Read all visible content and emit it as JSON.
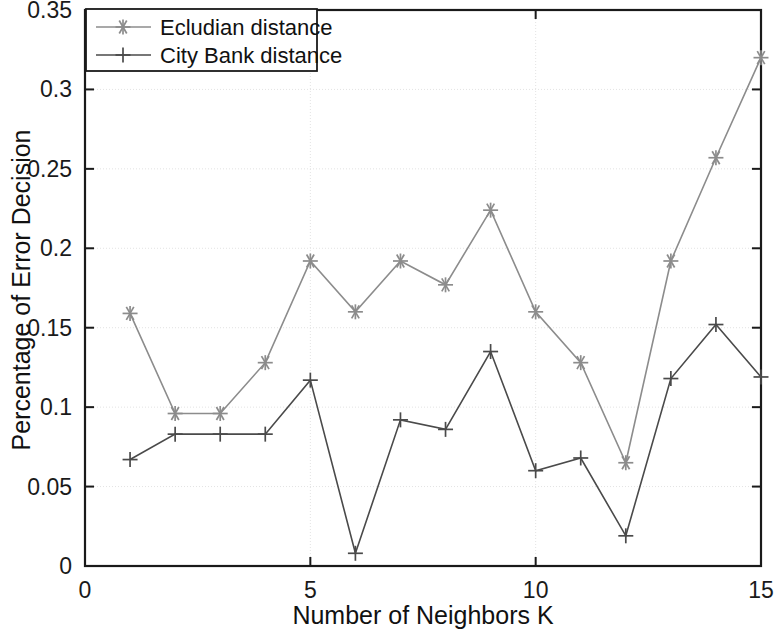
{
  "chart_data": {
    "type": "line",
    "title": "",
    "xlabel": "Number of Neighbors K",
    "ylabel": "Percentage of Error Decision",
    "xlim": [
      0,
      15
    ],
    "ylim": [
      0,
      0.35
    ],
    "xticks": [
      "0",
      "5",
      "10",
      "15"
    ],
    "xtick_values": [
      0,
      5,
      10,
      15
    ],
    "yticks": [
      "0",
      "0.05",
      "0.1",
      "0.15",
      "0.2",
      "0.25",
      "0.3",
      "0.35"
    ],
    "ytick_values": [
      0,
      0.05,
      0.1,
      0.15,
      0.2,
      0.25,
      0.3,
      0.35
    ],
    "grid": true,
    "legend_position": "top-left",
    "x": [
      1,
      2,
      3,
      4,
      5,
      6,
      7,
      8,
      9,
      10,
      11,
      12,
      13,
      14,
      15
    ],
    "series": [
      {
        "name": "Ecludian distance",
        "marker": "asterisk",
        "color": "#8c8c8c",
        "values": [
          0.159,
          0.096,
          0.096,
          0.128,
          0.192,
          0.16,
          0.192,
          0.177,
          0.224,
          0.16,
          0.128,
          0.065,
          0.192,
          0.257,
          0.32
        ]
      },
      {
        "name": "City Bank distance",
        "marker": "plus",
        "color": "#4a4a4a",
        "values": [
          0.067,
          0.083,
          0.083,
          0.083,
          0.117,
          0.008,
          0.092,
          0.086,
          0.135,
          0.06,
          0.068,
          0.019,
          0.118,
          0.152,
          0.119
        ]
      }
    ]
  },
  "axes": {
    "x_label": "Number of Neighbors K",
    "y_label": "Percentage of Error Decision"
  },
  "legend": {
    "entries": [
      {
        "label": "Ecludian distance",
        "marker": "asterisk-marker-icon"
      },
      {
        "label": "City Bank distance",
        "marker": "plus-marker-icon"
      }
    ]
  },
  "colors": {
    "euclidean": "#8c8c8c",
    "cityblock": "#4a4a4a",
    "axis": "#1a1a1a",
    "grid": "#e3e3e3",
    "background": "#ffffff"
  }
}
